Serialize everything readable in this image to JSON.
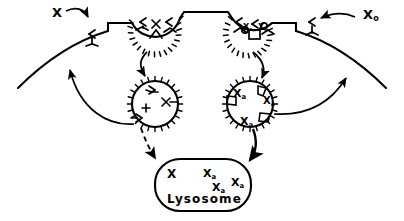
{
  "figure": {
    "type": "biology-diagram",
    "width": 404,
    "height": 221,
    "background_color": "#ffffff",
    "ink_color": "#000000"
  },
  "labels": {
    "extracellular_ligand_left": "X",
    "extracellular_ligand_right": "X",
    "extracellular_ligand_right_sub": "o",
    "membrane_receptor_left_bound": "X",
    "membrane_receptor_right_bound": "X",
    "membrane_receptor_right_sub": "o"
  },
  "coated_pit_right": {
    "ligands": [
      {
        "base": "X",
        "sub": "o"
      },
      {
        "base": "X",
        "sub": "o"
      }
    ]
  },
  "vesicle_right": {
    "ligands": [
      {
        "base": "X",
        "sub": "a"
      },
      {
        "base": "X",
        "sub": "a"
      },
      {
        "base": "X",
        "sub": "a"
      }
    ]
  },
  "lysosome": {
    "name": "Lysosome",
    "contents": [
      {
        "base": "X",
        "sub": ""
      },
      {
        "base": "X",
        "sub": "a"
      },
      {
        "base": "X",
        "sub": "a"
      },
      {
        "base": "X",
        "sub": "a"
      }
    ]
  },
  "arrows": {
    "ligand_binding_left": "curved-arrow-to-membrane",
    "ligand_binding_right": "curved-arrow-to-membrane",
    "internalization_left": "pit-to-vesicle-arrow",
    "internalization_right": "pit-to-vesicle-arrow",
    "to_lysosome_left": "dashed-arrow",
    "to_lysosome_right": "solid-arrow",
    "recycling_left": "curved-arrow-to-membrane",
    "recycling_right": "curved-arrow-to-membrane"
  }
}
